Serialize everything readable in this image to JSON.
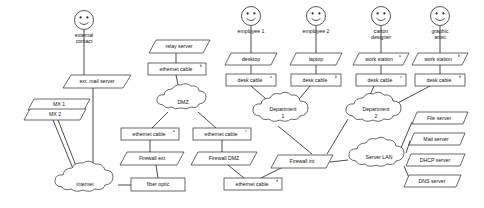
{
  "diagram": {
    "type": "network-infrastructure-diagram",
    "title": "",
    "actors": [
      {
        "id": "external-contact",
        "label_line1": "external",
        "label_line2": "contact",
        "x": 84,
        "y": 20
      },
      {
        "id": "employee-1",
        "label_line1": "employee 1",
        "label_line2": "",
        "x": 251,
        "y": 16
      },
      {
        "id": "employee-2",
        "label_line1": "employee 2",
        "label_line2": "",
        "x": 316,
        "y": 16
      },
      {
        "id": "carton-designer",
        "label_line1": "carton",
        "label_line2": "designer",
        "x": 381,
        "y": 16
      },
      {
        "id": "graphic-artist",
        "label_line1": "graphic",
        "label_line2": "artist",
        "x": 440,
        "y": 16
      }
    ],
    "parallelograms": [
      {
        "id": "ext-mail-server",
        "label": "ext. mail server",
        "sup": "",
        "x": 93,
        "y": 81,
        "w": 68,
        "h": 13
      },
      {
        "id": "mx-1",
        "label": "MX 1",
        "sup": "",
        "x": 57,
        "y": 104,
        "w": 56,
        "h": 11
      },
      {
        "id": "mx-2",
        "label": "MX 2",
        "sup": "",
        "x": 53,
        "y": 114,
        "w": 56,
        "h": 11
      },
      {
        "id": "relay-server",
        "label": "relay server",
        "sup": "",
        "x": 176,
        "y": 46,
        "w": 60,
        "h": 13
      },
      {
        "id": "firewall-ext",
        "label": "Firewall ext",
        "sup": "",
        "x": 148,
        "y": 158,
        "w": 60,
        "h": 13
      },
      {
        "id": "firewall-dmz",
        "label": "Firewall DMZ",
        "sup": "",
        "x": 220,
        "y": 158,
        "w": 62,
        "h": 13
      },
      {
        "id": "firewall-int",
        "label": "Firewall int",
        "sup": "",
        "x": 300,
        "y": 160,
        "w": 60,
        "h": 13
      },
      {
        "id": "desktop",
        "label": "desktop",
        "sup": "",
        "x": 251,
        "y": 59,
        "w": 52,
        "h": 12
      },
      {
        "id": "laptop",
        "label": "laptop",
        "sup": "",
        "x": 316,
        "y": 59,
        "w": 52,
        "h": 12
      },
      {
        "id": "work-station-a",
        "label": "work station",
        "sup": "a",
        "x": 381,
        "y": 59,
        "w": 56,
        "h": 12
      },
      {
        "id": "work-station-b",
        "label": "work station",
        "sup": "b",
        "x": 440,
        "y": 59,
        "w": 56,
        "h": 12
      },
      {
        "id": "file-server",
        "label": "File server",
        "sup": "",
        "x": 437,
        "y": 118,
        "w": 54,
        "h": 12
      },
      {
        "id": "mail-server",
        "label": "Mail server",
        "sup": "",
        "x": 434,
        "y": 139,
        "w": 54,
        "h": 12
      },
      {
        "id": "dhcp-server",
        "label": "DHCP server",
        "sup": "",
        "x": 434,
        "y": 160,
        "w": 56,
        "h": 12
      },
      {
        "id": "dns-server",
        "label": "DNS server",
        "sup": "",
        "x": 432,
        "y": 181,
        "w": 54,
        "h": 12
      }
    ],
    "rectangles": [
      {
        "id": "ethernet-cable-b-relay",
        "label": "ethernet cable",
        "sup": "b",
        "x": 176,
        "y": 69,
        "w": 58,
        "h": 12
      },
      {
        "id": "ethernet-cable-a",
        "label": "ethernet cable",
        "sup": "a",
        "x": 148,
        "y": 134,
        "w": 58,
        "h": 12
      },
      {
        "id": "ethernet-cable-c",
        "label": "ethernet cable",
        "sup": "c",
        "x": 220,
        "y": 134,
        "w": 58,
        "h": 12
      },
      {
        "id": "ethernet-cable-d",
        "label": "ethernet cable",
        "sup": "d",
        "x": 251,
        "y": 184,
        "w": 58,
        "h": 12
      },
      {
        "id": "fiber-optic",
        "label": "fiber optic",
        "sup": "",
        "x": 158,
        "y": 184,
        "w": 54,
        "h": 13
      },
      {
        "id": "desk-cable-a",
        "label": "desk cable",
        "sup": "a",
        "x": 251,
        "y": 80,
        "w": 50,
        "h": 12
      },
      {
        "id": "desk-cable-b",
        "label": "desk cable",
        "sup": "b",
        "x": 316,
        "y": 80,
        "w": 50,
        "h": 12
      },
      {
        "id": "desk-cable-c",
        "label": "desk cable",
        "sup": "c",
        "x": 381,
        "y": 80,
        "w": 50,
        "h": 12
      },
      {
        "id": "desk-cable-d",
        "label": "desk cable",
        "sup": "d",
        "x": 440,
        "y": 80,
        "w": 50,
        "h": 12
      }
    ],
    "clouds": [
      {
        "id": "internet",
        "label_line1": "internet",
        "label_line2": "",
        "cx": 85,
        "cy": 185,
        "rx": 36,
        "ry": 15
      },
      {
        "id": "dmz",
        "label_line1": "DMZ",
        "label_line2": "",
        "cx": 183,
        "cy": 103,
        "rx": 30,
        "ry": 13
      },
      {
        "id": "department-1",
        "label_line1": "Department",
        "label_line2": "1",
        "cx": 283,
        "cy": 113,
        "rx": 32,
        "ry": 14
      },
      {
        "id": "department-2",
        "label_line1": "Department",
        "label_line2": "2",
        "cx": 376,
        "cy": 113,
        "rx": 32,
        "ry": 14
      },
      {
        "id": "server-lan",
        "label_line1": "Server LAN",
        "label_line2": "",
        "cx": 380,
        "cy": 158,
        "rx": 33,
        "ry": 14
      }
    ],
    "edges": [
      {
        "from": "external-contact",
        "to": "ext-mail-server"
      },
      {
        "from": "ext-mail-server",
        "to": "internet"
      },
      {
        "from": "mx-1",
        "to": "internet"
      },
      {
        "from": "mx-2",
        "to": "internet"
      },
      {
        "from": "relay-server",
        "to": "ethernet-cable-b-relay"
      },
      {
        "from": "ethernet-cable-b-relay",
        "to": "dmz"
      },
      {
        "from": "dmz",
        "to": "ethernet-cable-a"
      },
      {
        "from": "dmz",
        "to": "ethernet-cable-c"
      },
      {
        "from": "ethernet-cable-a",
        "to": "firewall-ext"
      },
      {
        "from": "firewall-ext",
        "to": "fiber-optic"
      },
      {
        "from": "fiber-optic",
        "to": "internet"
      },
      {
        "from": "ethernet-cable-c",
        "to": "firewall-dmz"
      },
      {
        "from": "firewall-dmz",
        "to": "ethernet-cable-d"
      },
      {
        "from": "ethernet-cable-d",
        "to": "firewall-int"
      },
      {
        "from": "employee-1",
        "to": "desktop"
      },
      {
        "from": "desktop",
        "to": "desk-cable-a"
      },
      {
        "from": "desk-cable-a",
        "to": "department-1"
      },
      {
        "from": "employee-2",
        "to": "laptop"
      },
      {
        "from": "laptop",
        "to": "desk-cable-b"
      },
      {
        "from": "desk-cable-b",
        "to": "department-1"
      },
      {
        "from": "carton-designer",
        "to": "work-station-a"
      },
      {
        "from": "work-station-a",
        "to": "desk-cable-c"
      },
      {
        "from": "desk-cable-c",
        "to": "department-2"
      },
      {
        "from": "graphic-artist",
        "to": "work-station-b"
      },
      {
        "from": "work-station-b",
        "to": "desk-cable-d"
      },
      {
        "from": "desk-cable-d",
        "to": "department-2"
      },
      {
        "from": "department-1",
        "to": "firewall-int"
      },
      {
        "from": "department-2",
        "to": "firewall-int"
      },
      {
        "from": "firewall-int",
        "to": "server-lan"
      },
      {
        "from": "server-lan",
        "to": "file-server"
      },
      {
        "from": "server-lan",
        "to": "mail-server"
      },
      {
        "from": "server-lan",
        "to": "dhcp-server"
      },
      {
        "from": "server-lan",
        "to": "dns-server"
      }
    ]
  }
}
